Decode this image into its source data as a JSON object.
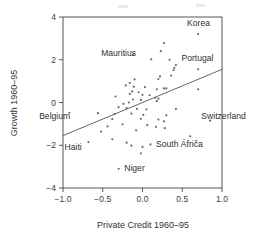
{
  "chart_data": {
    "type": "scatter",
    "title": "",
    "xlabel": "Private Credit 1960–95",
    "ylabel": "Growth 1960–95",
    "xlim": [
      -1.0,
      1.0
    ],
    "ylim": [
      -4,
      4
    ],
    "xticks": [
      -1.0,
      -0.5,
      0.0,
      0.5,
      1.0
    ],
    "xticklabels": [
      "−1.0",
      "−0.5",
      "0.0",
      "0.5",
      "1.0"
    ],
    "yticks": [
      -4,
      -2,
      0,
      2,
      4
    ],
    "yticklabels": [
      "−4",
      "−2",
      "0",
      "2",
      "4"
    ],
    "grid": false,
    "legend": "none",
    "marker": "open-circle-small",
    "trendline": {
      "label": "regression-line",
      "x0": -1.0,
      "y0": -1.55,
      "x1": 1.0,
      "y1": 1.55
    },
    "annotations": [
      {
        "label": "Korea",
        "x": 0.7,
        "y": 3.2,
        "tx": 0.56,
        "ty": 3.72,
        "anchor": "start"
      },
      {
        "label": "Mauritius",
        "x": -0.12,
        "y": 2.22,
        "tx": -0.52,
        "ty": 2.3,
        "anchor": "start"
      },
      {
        "label": "Portugal",
        "x": 0.42,
        "y": 1.75,
        "tx": 0.49,
        "ty": 2.08,
        "anchor": "start"
      },
      {
        "label": "Belgium",
        "x": -0.92,
        "y": -0.48,
        "tx": -1.3,
        "ty": -0.62,
        "anchor": "start"
      },
      {
        "label": "Switzerland",
        "x": 0.85,
        "y": -0.85,
        "tx": 0.74,
        "ty": -0.62,
        "anchor": "start"
      },
      {
        "label": "Haiti",
        "x": -0.68,
        "y": -1.85,
        "tx": -0.98,
        "ty": -2.08,
        "anchor": "start"
      },
      {
        "label": "South Áfriča",
        "x": 0.6,
        "y": -1.58,
        "tx": 0.17,
        "ty": -1.96,
        "anchor": "start"
      },
      {
        "label": "Niger",
        "x": -0.3,
        "y": -3.1,
        "tx": -0.23,
        "ty": -3.06,
        "anchor": "start"
      }
    ],
    "points": [
      [
        0.7,
        3.2
      ],
      [
        0.27,
        2.78
      ],
      [
        0.23,
        2.4
      ],
      [
        -0.12,
        2.22
      ],
      [
        0.11,
        2.02
      ],
      [
        0.34,
        2.0
      ],
      [
        0.42,
        1.75
      ],
      [
        0.4,
        1.62
      ],
      [
        0.39,
        1.52
      ],
      [
        0.7,
        1.55
      ],
      [
        0.36,
        1.26
      ],
      [
        0.22,
        1.22
      ],
      [
        0.2,
        1.1
      ],
      [
        -0.1,
        1.08
      ],
      [
        -0.16,
        0.92
      ],
      [
        -0.21,
        0.8
      ],
      [
        -0.11,
        0.74
      ],
      [
        0.03,
        0.72
      ],
      [
        0.18,
        0.62
      ],
      [
        0.27,
        0.66
      ],
      [
        0.3,
        0.66
      ],
      [
        0.7,
        0.62
      ],
      [
        -0.13,
        0.52
      ],
      [
        -0.05,
        0.48
      ],
      [
        -0.16,
        0.4
      ],
      [
        0.0,
        0.36
      ],
      [
        0.09,
        0.34
      ],
      [
        -0.34,
        0.28
      ],
      [
        0.16,
        0.22
      ],
      [
        0.2,
        0.18
      ],
      [
        -0.12,
        0.14
      ],
      [
        -0.02,
        0.12
      ],
      [
        0.18,
        0.06
      ],
      [
        -0.17,
        0.0
      ],
      [
        -0.24,
        -0.06
      ],
      [
        -0.92,
        -0.48
      ],
      [
        -0.3,
        -0.22
      ],
      [
        -0.2,
        -0.26
      ],
      [
        -0.07,
        -0.3
      ],
      [
        0.05,
        -0.32
      ],
      [
        0.42,
        -0.3
      ],
      [
        -0.56,
        -0.5
      ],
      [
        -0.35,
        -0.54
      ],
      [
        -0.14,
        -0.52
      ],
      [
        0.01,
        -0.58
      ],
      [
        0.3,
        -0.6
      ],
      [
        0.85,
        -0.85
      ],
      [
        -0.38,
        -0.78
      ],
      [
        -0.02,
        -0.76
      ],
      [
        0.2,
        -0.8
      ],
      [
        0.27,
        -0.88
      ],
      [
        -0.25,
        -1.02
      ],
      [
        -0.44,
        -1.12
      ],
      [
        0.06,
        -1.06
      ],
      [
        0.17,
        -1.14
      ],
      [
        0.28,
        -1.2
      ],
      [
        -0.08,
        -1.3
      ],
      [
        -0.52,
        -1.36
      ],
      [
        0.6,
        -1.58
      ],
      [
        -0.68,
        -1.85
      ],
      [
        -0.38,
        -1.72
      ],
      [
        -0.2,
        -1.88
      ],
      [
        -0.14,
        -2.02
      ],
      [
        0.0,
        -2.08
      ],
      [
        0.1,
        -1.96
      ],
      [
        -0.02,
        -2.38
      ],
      [
        -0.3,
        -3.1
      ]
    ],
    "scan_artifacts": [
      {
        "x": 118,
        "y": 5,
        "w": 10,
        "h": 3
      },
      {
        "x": 196,
        "y": 4,
        "w": 9,
        "h": 3
      }
    ]
  }
}
